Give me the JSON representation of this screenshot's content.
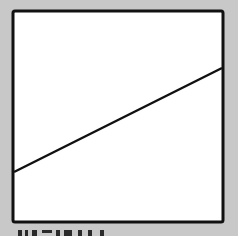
{
  "figure": {
    "background_color": "#c8c8c8",
    "frame": {
      "x": 13,
      "y": 11,
      "width": 210,
      "height": 211,
      "fill": "#ffffff",
      "stroke": "#111111",
      "stroke_width": 3
    },
    "line": {
      "x1": 14,
      "y1": 172,
      "x2": 222,
      "y2": 68,
      "stroke": "#111111",
      "stroke_width": 2.5
    },
    "caption": {
      "visible": true,
      "legible": false
    }
  }
}
